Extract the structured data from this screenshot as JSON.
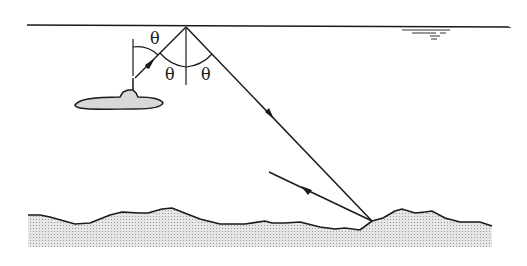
{
  "diagram": {
    "type": "sonar surface-reflection diagram",
    "labels": {
      "angle_upper_left": "θ",
      "angle_lower_left": "θ",
      "angle_lower_right": "θ"
    },
    "colors": {
      "line": "#1a1a1a",
      "seabed_fill": "#d4d4d4",
      "submarine_fill": "#d8d8d8",
      "background": "#ffffff"
    },
    "elements": [
      "sea-surface",
      "submarine",
      "incident-ray",
      "reflected-ray",
      "seabed-return-ray",
      "normal-line",
      "angle-arcs",
      "seabed"
    ]
  }
}
